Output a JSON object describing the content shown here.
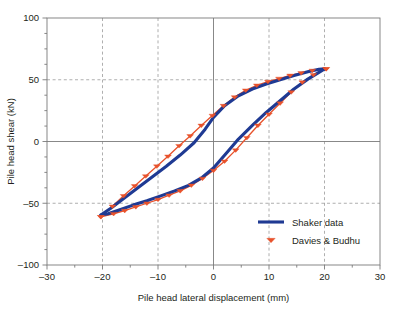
{
  "chart_data": {
    "type": "line",
    "title": "",
    "xlabel": "Pile head lateral displacement (mm)",
    "ylabel": "Pile head shear (kN)",
    "xlim": [
      -30,
      30
    ],
    "ylim": [
      -100,
      100
    ],
    "xticks": [
      "-30",
      "-20",
      "-10",
      "0",
      "10",
      "20",
      "30"
    ],
    "xtick_values": [
      -30,
      -20,
      -10,
      0,
      10,
      20,
      30
    ],
    "yticks": [
      "100",
      "50",
      "0",
      "-50",
      "-100"
    ],
    "ytick_values": [
      100,
      50,
      0,
      -50,
      -100
    ],
    "minor_tick_step_x": 5,
    "minor_tick_step_y": 12.5,
    "grid": "dashed gridlines at x = -20, -10, 10, 20 and y = 50, -50; solid axes at x = 0 and y = 0",
    "legend_position": "lower right inside plot",
    "colors": {
      "shaker": "#1f3a93",
      "davies": "#e8522b",
      "axis": "#7a7a7a",
      "grid": "#9a9a9a",
      "text": "#231f20",
      "background": "#ffffff"
    },
    "series": [
      {
        "name": "Shaker data",
        "style": "solid thick line, hysteresis loop",
        "marker": "none",
        "color": "#1f3a93",
        "upper_branch": [
          [
            -20.3,
            -59.5
          ],
          [
            -18.5,
            -54.0
          ],
          [
            -16.0,
            -45.5
          ],
          [
            -13.5,
            -37.0
          ],
          [
            -11.0,
            -28.5
          ],
          [
            -8.5,
            -20.0
          ],
          [
            -6.0,
            -11.0
          ],
          [
            -3.5,
            -1.0
          ],
          [
            -1.5,
            10.0
          ],
          [
            0.0,
            19.5
          ],
          [
            2.0,
            29.0
          ],
          [
            4.5,
            37.0
          ],
          [
            7.0,
            42.5
          ],
          [
            9.5,
            46.5
          ],
          [
            12.0,
            50.0
          ],
          [
            14.5,
            53.5
          ],
          [
            17.0,
            56.5
          ],
          [
            19.0,
            58.5
          ],
          [
            20.0,
            58.8
          ]
        ],
        "lower_branch": [
          [
            20.0,
            58.8
          ],
          [
            19.0,
            56.0
          ],
          [
            17.0,
            50.5
          ],
          [
            14.5,
            42.5
          ],
          [
            12.0,
            33.0
          ],
          [
            9.5,
            23.5
          ],
          [
            7.0,
            13.0
          ],
          [
            4.5,
            2.0
          ],
          [
            2.5,
            -8.5
          ],
          [
            0.0,
            -21.5
          ],
          [
            -2.0,
            -29.0
          ],
          [
            -4.5,
            -35.5
          ],
          [
            -7.0,
            -40.0
          ],
          [
            -9.5,
            -44.0
          ],
          [
            -12.0,
            -48.0
          ],
          [
            -14.5,
            -51.5
          ],
          [
            -17.0,
            -55.5
          ],
          [
            -19.0,
            -58.5
          ],
          [
            -20.3,
            -59.5
          ]
        ]
      },
      {
        "name": "Davies & Budhu",
        "style": "thin line with triangle markers, hysteresis loop",
        "marker": "triangle",
        "color": "#e8522b",
        "upper_branch": [
          [
            -20.3,
            -61.0
          ],
          [
            -18.2,
            -52.5
          ],
          [
            -16.2,
            -44.0
          ],
          [
            -14.2,
            -36.0
          ],
          [
            -12.2,
            -28.0
          ],
          [
            -10.2,
            -20.0
          ],
          [
            -8.2,
            -12.0
          ],
          [
            -6.2,
            -3.5
          ],
          [
            -4.2,
            4.5
          ],
          [
            -2.2,
            13.0
          ],
          [
            -0.2,
            21.0
          ],
          [
            1.8,
            29.0
          ],
          [
            3.8,
            36.0
          ],
          [
            5.8,
            41.5
          ],
          [
            7.8,
            45.5
          ],
          [
            9.8,
            48.5
          ],
          [
            11.8,
            51.0
          ],
          [
            13.8,
            53.5
          ],
          [
            15.8,
            55.5
          ],
          [
            17.8,
            57.5
          ],
          [
            20.3,
            58.8
          ]
        ],
        "lower_branch": [
          [
            20.3,
            58.8
          ],
          [
            18.0,
            54.0
          ],
          [
            16.0,
            48.0
          ],
          [
            14.0,
            40.0
          ],
          [
            12.0,
            31.0
          ],
          [
            10.0,
            22.0
          ],
          [
            8.0,
            13.0
          ],
          [
            6.0,
            3.0
          ],
          [
            4.0,
            -7.0
          ],
          [
            2.0,
            -16.0
          ],
          [
            0.0,
            -23.5
          ],
          [
            -2.0,
            -30.0
          ],
          [
            -4.0,
            -35.5
          ],
          [
            -6.0,
            -40.0
          ],
          [
            -8.0,
            -43.5
          ],
          [
            -10.0,
            -47.0
          ],
          [
            -12.0,
            -50.0
          ],
          [
            -14.0,
            -53.0
          ],
          [
            -16.0,
            -56.0
          ],
          [
            -18.0,
            -58.5
          ],
          [
            -20.3,
            -61.0
          ]
        ]
      }
    ],
    "legend": [
      {
        "label": "Shaker data",
        "type": "line",
        "color": "#1f3a93"
      },
      {
        "label": "Davies & Budhu",
        "type": "triangle",
        "color": "#e8522b"
      }
    ]
  }
}
